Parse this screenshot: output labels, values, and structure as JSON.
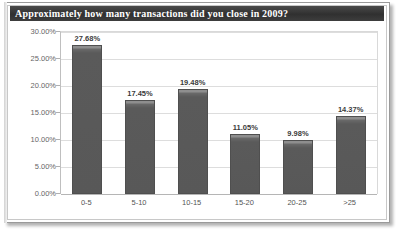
{
  "chart_data": {
    "type": "bar",
    "title": "Approximately how many transactions did you close in 2009?",
    "xlabel": "",
    "ylabel": "",
    "categories": [
      "0-5",
      "5-10",
      "10-15",
      "15-20",
      "20-25",
      ">25"
    ],
    "values": [
      27.68,
      17.45,
      19.48,
      11.05,
      9.98,
      14.37
    ],
    "value_labels": [
      "27.68%",
      "17.45%",
      "19.48%",
      "11.05%",
      "9.98%",
      "14.37%"
    ],
    "ylim": [
      0,
      30
    ],
    "ytick_values": [
      0,
      5,
      10,
      15,
      20,
      25,
      30
    ],
    "ytick_labels": [
      "0.00%",
      "5.00%",
      "10.00%",
      "15.00%",
      "20.00%",
      "25.00%",
      "30.00%"
    ],
    "grid": true,
    "legend": false,
    "legend_position": "none",
    "series": [
      {
        "name": "Responses",
        "values": [
          27.68,
          17.45,
          19.48,
          11.05,
          9.98,
          14.37
        ]
      }
    ],
    "colors": {
      "bar": "#595959",
      "bar_border": "#4f4f4f",
      "bar_highlight": "#8e8e8e",
      "gridline": "#dddddd",
      "axis": "#b5b5b5",
      "title_bar": "#3a3a3a",
      "title_text": "#ffffff",
      "tick_label": "#666666",
      "category_label": "#555555",
      "value_label": "#3b3b3b",
      "plot_background": "#ffffff",
      "frame_border": "#9a9a9a"
    }
  }
}
